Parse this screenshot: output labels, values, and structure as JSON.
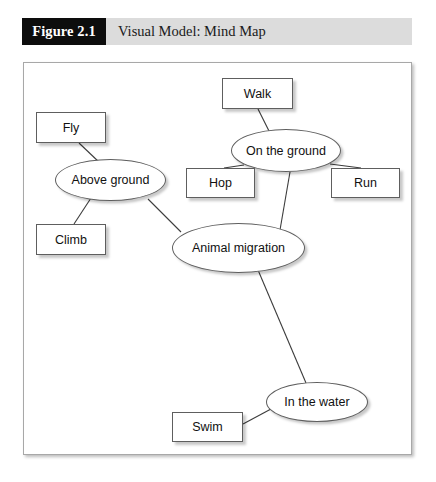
{
  "figure": {
    "number_label": "Figure 2.1",
    "caption": "Visual Model: Mind Map",
    "number_box_color": "#0d0d0d",
    "bar_color": "#dcdcdc",
    "caption_color": "#1a1a1a"
  },
  "diagram": {
    "type": "mind-map",
    "panel_border_color": "#a8a8a8",
    "node_border_color": "#5e5e5e",
    "node_fill_color": "#ffffff",
    "edge_color": "#3c3c3c",
    "nodes": [
      {
        "id": "walk",
        "label": "Walk",
        "shape": "rect",
        "x": 222,
        "y": 78,
        "w": 71,
        "h": 31
      },
      {
        "id": "fly",
        "label": "Fly",
        "shape": "rect",
        "x": 36,
        "y": 112,
        "w": 70,
        "h": 31
      },
      {
        "id": "on-the-ground",
        "label": "On the ground",
        "shape": "ellipse",
        "x": 231,
        "y": 129,
        "w": 110,
        "h": 43
      },
      {
        "id": "above-ground",
        "label": "Above ground",
        "shape": "ellipse",
        "x": 55,
        "y": 159,
        "w": 111,
        "h": 42
      },
      {
        "id": "hop",
        "label": "Hop",
        "shape": "rect",
        "x": 186,
        "y": 168,
        "w": 69,
        "h": 30
      },
      {
        "id": "run",
        "label": "Run",
        "shape": "rect",
        "x": 331,
        "y": 168,
        "w": 69,
        "h": 30
      },
      {
        "id": "climb",
        "label": "Climb",
        "shape": "rect",
        "x": 36,
        "y": 224,
        "w": 70,
        "h": 31
      },
      {
        "id": "animal-migration",
        "label": "Animal migration",
        "shape": "ellipse",
        "x": 172,
        "y": 223,
        "w": 133,
        "h": 50
      },
      {
        "id": "in-the-water",
        "label": "In the water",
        "shape": "ellipse",
        "x": 266,
        "y": 382,
        "w": 102,
        "h": 40
      },
      {
        "id": "swim",
        "label": "Swim",
        "shape": "rect",
        "x": 172,
        "y": 412,
        "w": 71,
        "h": 30
      }
    ],
    "edges": [
      {
        "id": "edge-animal-above",
        "from": "animal-migration",
        "to": "above-ground",
        "x1": 181,
        "y1": 232,
        "x2": 148,
        "y2": 199
      },
      {
        "id": "edge-animal-onground",
        "from": "animal-migration",
        "to": "on-the-ground",
        "x1": 280,
        "y1": 230,
        "x2": 290,
        "y2": 172
      },
      {
        "id": "edge-animal-water",
        "from": "animal-migration",
        "to": "in-the-water",
        "x1": 258,
        "y1": 270,
        "x2": 306,
        "y2": 383
      },
      {
        "id": "edge-above-fly",
        "from": "above-ground",
        "to": "fly",
        "x1": 100,
        "y1": 163,
        "x2": 79,
        "y2": 143
      },
      {
        "id": "edge-above-climb",
        "from": "above-ground",
        "to": "climb",
        "x1": 91,
        "y1": 198,
        "x2": 74,
        "y2": 224
      },
      {
        "id": "edge-onground-walk",
        "from": "on-the-ground",
        "to": "walk",
        "x1": 270,
        "y1": 133,
        "x2": 258,
        "y2": 109
      },
      {
        "id": "edge-onground-hop",
        "from": "on-the-ground",
        "to": "hop",
        "x1": 244,
        "y1": 165,
        "x2": 224,
        "y2": 168
      },
      {
        "id": "edge-onground-run",
        "from": "on-the-ground",
        "to": "run",
        "x1": 330,
        "y1": 164,
        "x2": 361,
        "y2": 168
      },
      {
        "id": "edge-water-swim",
        "from": "in-the-water",
        "to": "swim",
        "x1": 271,
        "y1": 409,
        "x2": 243,
        "y2": 424
      }
    ]
  }
}
